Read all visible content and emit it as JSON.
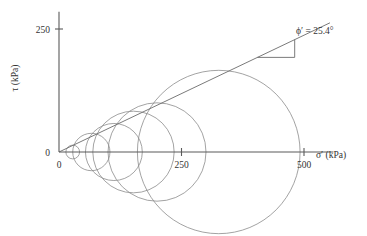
{
  "chart_data": {
    "type": "line",
    "title": "",
    "xlabel": "σ′ (kPa)",
    "ylabel": "τ (kPa)",
    "xlim": [
      0,
      560
    ],
    "ylim": [
      0,
      285
    ],
    "grid": false,
    "legend": "none",
    "xticks": [
      {
        "value": 0,
        "label": "0"
      },
      {
        "value": 250,
        "label": "250"
      },
      {
        "value": 500,
        "label": "500"
      }
    ],
    "yticks": [
      {
        "value": 0,
        "label": "0"
      },
      {
        "value": 250,
        "label": "250"
      }
    ],
    "annotations": [
      {
        "name": "friction-angle",
        "text": "ϕ′ = 25.4°",
        "x": 430,
        "y": 215
      }
    ],
    "failure_envelope": {
      "name": "Mohr-Coulomb failure envelope",
      "cohesion_intercept": 0,
      "friction_angle_deg": 25.4,
      "x_start": 0,
      "x_end": 553
    },
    "angle_marker_triangle": {
      "x_start": 405,
      "x_end": 481,
      "description": "right triangle indicating envelope slope"
    },
    "mohr_circles": [
      {
        "name": "circle-1",
        "sigma3": 14,
        "sigma1": 42,
        "center": 28,
        "radius": 14
      },
      {
        "name": "circle-2",
        "sigma3": 28,
        "sigma1": 104,
        "center": 66,
        "radius": 38
      },
      {
        "name": "circle-3",
        "sigma3": 55,
        "sigma1": 170,
        "center": 112,
        "radius": 58
      },
      {
        "name": "circle-4",
        "sigma3": 70,
        "sigma1": 235,
        "center": 152,
        "radius": 83
      },
      {
        "name": "circle-5",
        "sigma3": 100,
        "sigma1": 300,
        "center": 200,
        "radius": 100
      },
      {
        "name": "circle-6",
        "sigma3": 160,
        "sigma1": 492,
        "center": 326,
        "radius": 166
      }
    ]
  }
}
